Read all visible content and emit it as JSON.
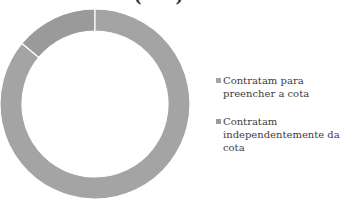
{
  "title": {
    "visible_fragment_left": "(",
    "visible_fragment_right": ")"
  },
  "chart_data": {
    "type": "pie",
    "subtype": "donut",
    "title": "",
    "categories": [
      "Contratam independentemente da cota",
      "Contratam para preencher a cota"
    ],
    "values": [
      14,
      86
    ],
    "units": "percent (estimated from slice angles)",
    "colors": [
      "#9a9a9a",
      "#a4a4a4"
    ],
    "start_angle": "12 o'clock, small slice counterclockwise",
    "legend_position": "right",
    "legend": [
      {
        "label": "Contratam para preencher a cota",
        "color": "#a4a4a4"
      },
      {
        "label": "Contratam independentemente da cota",
        "color": "#9a9a9a"
      }
    ]
  },
  "legend": {
    "items": [
      {
        "label": "Contratam para preencher a cota",
        "color": "#a4a4a4"
      },
      {
        "label": "Contratam independentemente da cota",
        "color": "#9a9a9a"
      }
    ]
  },
  "style": {
    "separator_color": "#ffffff",
    "background": "#ffffff"
  }
}
